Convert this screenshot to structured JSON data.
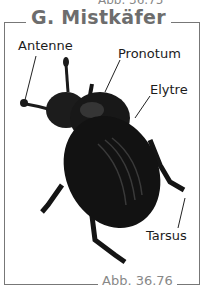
{
  "previous_caption": "Abb. 36.75",
  "figure": {
    "title": "G. Mistkäfer",
    "caption": "Abb. 36.76",
    "labels": {
      "antenne": "Antenne",
      "pronotum": "Pronotum",
      "elytre": "Elytre",
      "tarsus": "Tarsus"
    }
  },
  "colors": {
    "frame": "#777777",
    "title": "#6d6d6d",
    "caption": "#888888",
    "beetle": "#141414"
  }
}
